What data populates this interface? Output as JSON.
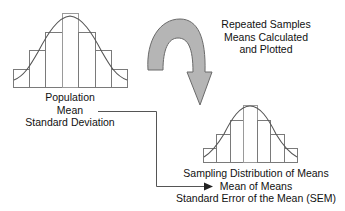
{
  "population": {
    "lines": [
      "Population",
      "Mean",
      "Standard Deviation"
    ]
  },
  "process": {
    "lines": [
      "Repeated Samples",
      "Means Calculated",
      "and Plotted"
    ]
  },
  "sampling_distribution": {
    "lines": [
      "Sampling Distribution of Means",
      "Mean of Means",
      "Standard Error of the Mean (SEM)"
    ]
  },
  "colors": {
    "arrow_fill": "#b5b5b5",
    "arrow_stroke": "#6a6a6a",
    "line": "#555555",
    "text": "#111111"
  },
  "histograms": {
    "population": {
      "bars": 7,
      "relative_heights": [
        1,
        2,
        3,
        4,
        3,
        2,
        1
      ]
    },
    "sampling": {
      "bars": 7,
      "relative_heights": [
        1,
        2,
        3,
        4,
        3,
        2,
        1
      ]
    }
  }
}
